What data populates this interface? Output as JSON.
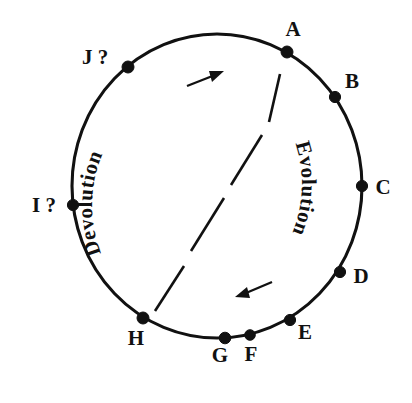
{
  "figure": {
    "background_color": "#ffffff",
    "ink_color": "#111111",
    "circle": {
      "cx": 217,
      "cy": 186,
      "rx": 145,
      "ry": 152
    },
    "nodes": [
      {
        "id": "A",
        "label": "A",
        "x": 287,
        "y": 52,
        "label_x": 293,
        "label_y": 36,
        "anchor": "middle"
      },
      {
        "id": "B",
        "label": "B",
        "x": 335,
        "y": 97,
        "label_x": 352,
        "label_y": 88,
        "anchor": "middle"
      },
      {
        "id": "C",
        "label": "C",
        "x": 362,
        "y": 186,
        "label_x": 383,
        "label_y": 194,
        "anchor": "middle"
      },
      {
        "id": "D",
        "label": "D",
        "x": 340,
        "y": 272,
        "label_x": 361,
        "label_y": 283,
        "anchor": "middle"
      },
      {
        "id": "E",
        "label": "E",
        "x": 290,
        "y": 320,
        "label_x": 305,
        "label_y": 339,
        "anchor": "middle"
      },
      {
        "id": "F",
        "label": "F",
        "x": 250,
        "y": 335,
        "label_x": 251,
        "label_y": 361,
        "anchor": "middle"
      },
      {
        "id": "G",
        "label": "G",
        "x": 225,
        "y": 338,
        "label_x": 220,
        "label_y": 362,
        "anchor": "middle"
      },
      {
        "id": "H",
        "label": "H",
        "x": 143,
        "y": 318,
        "label_x": 136,
        "label_y": 345,
        "anchor": "middle"
      },
      {
        "id": "I",
        "label": "I ?",
        "x": 73,
        "y": 205,
        "label_x": 44,
        "label_y": 212,
        "anchor": "middle"
      },
      {
        "id": "J",
        "label": "J ?",
        "x": 128,
        "y": 67,
        "label_x": 95,
        "label_y": 64,
        "anchor": "middle"
      }
    ],
    "curved_labels": [
      {
        "id": "devolution",
        "text": "Devolution",
        "orientation": "ascending-left-arc"
      },
      {
        "id": "evolution",
        "text": "Evolution",
        "orientation": "descending-right-arc-inverted"
      }
    ],
    "arrows": [
      {
        "id": "devolution-arrow",
        "direction": "up-right",
        "from_x": 187,
        "from_y": 86,
        "to_x": 223,
        "to_y": 72
      },
      {
        "id": "evolution-arrow",
        "direction": "down-left",
        "from_x": 272,
        "from_y": 282,
        "to_x": 235,
        "to_y": 297
      }
    ],
    "divider": {
      "id": "dashed-diagonal",
      "description": "dash-dot diagonal line from lower-left to upper-right",
      "segments": [
        {
          "x1": 155,
          "y1": 311,
          "x2": 184,
          "y2": 266
        },
        {
          "x1": 191,
          "y1": 251,
          "x2": 224,
          "y2": 198
        },
        {
          "x1": 231,
          "y1": 185,
          "x2": 262,
          "y2": 135
        },
        {
          "x1": 269,
          "y1": 122,
          "x2": 280,
          "y2": 74
        }
      ]
    }
  }
}
